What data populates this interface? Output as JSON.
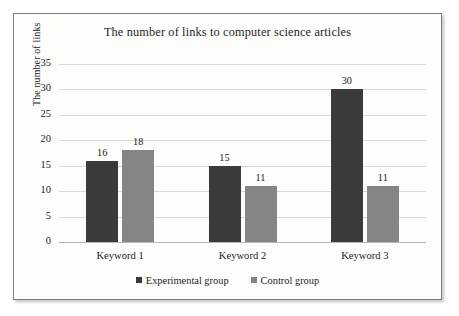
{
  "chart_data": {
    "type": "bar",
    "title": "The number of links to computer science articles",
    "xlabel": "",
    "ylabel": "The number of links",
    "categories": [
      "Keyword 1",
      "Keyword 2",
      "Keyword 3"
    ],
    "series": [
      {
        "name": "Experimental group",
        "color": "#3b3b3b",
        "values": [
          16,
          15,
          30
        ]
      },
      {
        "name": "Control group",
        "color": "#858585",
        "values": [
          18,
          11,
          11
        ]
      }
    ],
    "ylim": [
      0,
      35
    ],
    "yticks": [
      0,
      5,
      10,
      15,
      20,
      25,
      30,
      35
    ],
    "ytick_labels": [
      "0",
      "5",
      "10",
      "15",
      "20",
      "25",
      "30",
      "35"
    ],
    "data_labels": {
      "Keyword 1": [
        "16",
        "18"
      ],
      "Keyword 2": [
        "15",
        "11"
      ],
      "Keyword 3": [
        "30",
        "11"
      ]
    },
    "grid": true,
    "grid_orientation": "horizontal",
    "legend_position": "bottom",
    "gridline_color": "#d8d8d8",
    "axis_color": "#b9b9b9",
    "background": "#fdfdfc"
  }
}
